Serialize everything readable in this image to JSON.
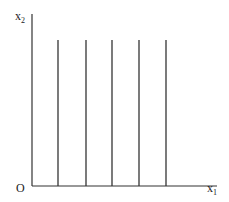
{
  "diagram": {
    "y_axis_label": "x",
    "y_axis_sub": "2",
    "x_axis_label": "x",
    "x_axis_sub": "1",
    "origin_label": "O",
    "line_color": "#333333",
    "vertical_lines_x": [
      58,
      86,
      112,
      139,
      166
    ],
    "vertical_lines_top": 40,
    "axis_baseline_y": 186
  }
}
